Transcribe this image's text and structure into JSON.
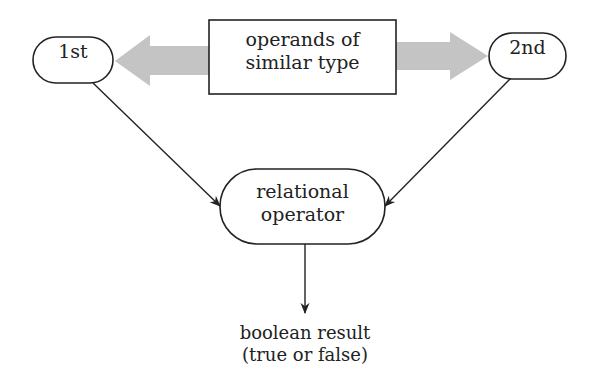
{
  "diagram": {
    "nodes": {
      "first_operand": {
        "label": "1st"
      },
      "second_operand": {
        "label": "2nd"
      },
      "operands_box": {
        "line1": "operands of",
        "line2": "similar type"
      },
      "relational_operator": {
        "line1": "relational",
        "line2": "operator"
      },
      "result": {
        "line1": "boolean result",
        "line2": "(true or false)"
      }
    },
    "edges": [
      {
        "from": "operands_box",
        "to": "first_operand",
        "style": "wide gray arrow"
      },
      {
        "from": "operands_box",
        "to": "second_operand",
        "style": "wide gray arrow"
      },
      {
        "from": "first_operand",
        "to": "relational_operator",
        "style": "thin black arrow"
      },
      {
        "from": "second_operand",
        "to": "relational_operator",
        "style": "thin black arrow"
      },
      {
        "from": "relational_operator",
        "to": "result",
        "style": "thin black arrow"
      }
    ],
    "colors": {
      "stroke": "#222222",
      "gray_arrow": "#c4c4c4",
      "background": "#ffffff"
    }
  }
}
